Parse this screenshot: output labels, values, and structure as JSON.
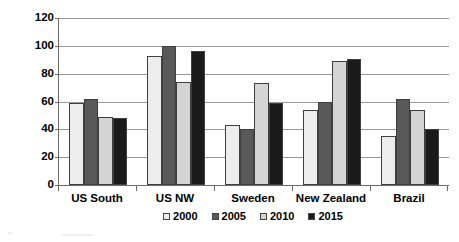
{
  "chart_data": {
    "type": "bar",
    "title": "",
    "subtitle": "",
    "xlabel": "",
    "ylabel": "US dollar per cubic meter",
    "ylim": [
      0,
      120
    ],
    "ytick_step": 20,
    "yticks": [
      120,
      100,
      80,
      60,
      40,
      20,
      0
    ],
    "grid": true,
    "legend_position": "bottom",
    "categories": [
      "US South",
      "US NW",
      "Sweden",
      "New Zealand",
      "Brazil"
    ],
    "series": [
      {
        "name": "2000",
        "color": "#ededed",
        "values": [
          59,
          93,
          43,
          54,
          35.5
        ]
      },
      {
        "name": "2005",
        "color": "#595959",
        "values": [
          62,
          100,
          40.5,
          59.5,
          62
        ]
      },
      {
        "name": "2010",
        "color": "#d4d4d4",
        "values": [
          49,
          74,
          73,
          89,
          54
        ]
      },
      {
        "name": "2015",
        "color": "#1a1a1a",
        "values": [
          48.5,
          96,
          59,
          90.5,
          40
        ]
      }
    ]
  },
  "colors": {
    "axis": "#6b6b6b",
    "grid": "#9a9a9a",
    "bar_border": "#3f3f3f",
    "text": "#000000",
    "background": "#ffffff"
  }
}
